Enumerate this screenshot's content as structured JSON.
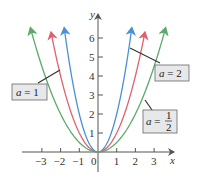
{
  "chart_data": {
    "type": "line",
    "title": "",
    "xlabel": "x",
    "ylabel": "y",
    "xlim": [
      -3.5,
      3.7
    ],
    "ylim": [
      -1.2,
      6.8
    ],
    "x_ticks": [
      -3,
      -2,
      -1,
      0,
      1,
      2,
      3
    ],
    "y_ticks": [
      1,
      2,
      3,
      4,
      5,
      6
    ],
    "x_tick_labels": [
      "−3",
      "−2",
      "−1",
      "0",
      "1",
      "2",
      "3"
    ],
    "y_tick_labels": [
      "1",
      "2",
      "3",
      "4",
      "5",
      "6"
    ],
    "grid": false,
    "series": [
      {
        "name": "a = 2",
        "formula": "y = 2x^2",
        "a": 2,
        "color": "#4a90d9",
        "x_range": [
          -1.8,
          1.8
        ]
      },
      {
        "name": "a = 1",
        "formula": "y = x^2",
        "a": 1,
        "color": "#e06070",
        "x_range": [
          -2.5,
          2.5
        ]
      },
      {
        "name": "a = 1/2",
        "formula": "y = (1/2)x^2",
        "a": 0.5,
        "color": "#5aaa6a",
        "x_range": [
          -3.6,
          3.6
        ]
      }
    ],
    "annotations": [
      {
        "text": "a = 1",
        "points_to": "a = 1"
      },
      {
        "text": "a = 2",
        "points_to": "a = 2"
      },
      {
        "text": "a = 1/2",
        "points_to": "a = 1/2"
      }
    ]
  },
  "labels": {
    "x_axis": "x",
    "y_axis": "y",
    "a1_var": "a",
    "a1_eq": " = 1",
    "a2_var": "a",
    "a2_eq": " = 2",
    "ahalf_var": "a",
    "ahalf_eq": " = ",
    "ahalf_num": "1",
    "ahalf_den": "2"
  }
}
